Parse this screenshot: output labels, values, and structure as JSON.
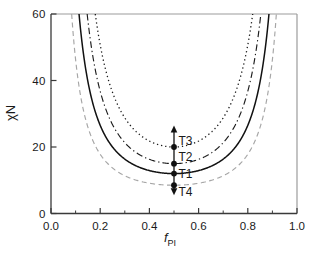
{
  "figure": {
    "ylabel": "χN",
    "xlabel_base": "f",
    "xlabel_sub": "PI"
  },
  "colors": {
    "background": "#ffffff",
    "axis": "#3a3a3a",
    "frame_light": "#9c9c9c",
    "text": "#1a1a1a",
    "marker": "#111111"
  },
  "chart_data": {
    "type": "line",
    "title": "",
    "xlabel": "f_PI",
    "ylabel": "χN",
    "xlim": [
      0.0,
      1.0
    ],
    "ylim": [
      0,
      60
    ],
    "grid": false,
    "legend": false,
    "frame": true,
    "x_major_ticks": [
      0.0,
      0.2,
      0.4,
      0.6,
      0.8,
      1.0
    ],
    "x_tick_labels": [
      "0.0",
      "0.2",
      "0.4",
      "0.6",
      "0.8",
      "1.0"
    ],
    "x_minor_ticks": [
      0.1,
      0.3,
      0.5,
      0.7,
      0.9
    ],
    "y_major_ticks": [
      0,
      20,
      40,
      60
    ],
    "y_tick_labels": [
      "0",
      "20",
      "40",
      "60"
    ],
    "series": [
      {
        "name": "boundary-dotted",
        "style": "dotted",
        "color": "#1c1c1c",
        "symmetric_about": 0.5,
        "min_chiN": 20.0,
        "f_at_ylim_top": 0.18
      },
      {
        "name": "boundary-dashdot",
        "style": "dashdot",
        "color": "#1c1c1c",
        "symmetric_about": 0.5,
        "min_chiN": 15.0,
        "f_at_ylim_top": 0.147
      },
      {
        "name": "boundary-solid",
        "style": "solid",
        "color": "#111111",
        "symmetric_about": 0.5,
        "min_chiN": 12.0,
        "f_at_ylim_top": 0.114
      },
      {
        "name": "boundary-dashed",
        "style": "dashed",
        "color": "#a6a6a6",
        "symmetric_about": 0.5,
        "min_chiN": 8.5,
        "f_at_ylim_top": 0.084
      }
    ],
    "points": [
      {
        "label": "T3",
        "x": 0.5,
        "y": 20.0,
        "label_pos": "above-right"
      },
      {
        "label": "T2",
        "x": 0.5,
        "y": 15.0,
        "label_pos": "above-right"
      },
      {
        "label": "T1",
        "x": 0.5,
        "y": 12.0,
        "label_pos": "right"
      },
      {
        "label": "T4",
        "x": 0.5,
        "y": 8.5,
        "label_pos": "below-right"
      }
    ],
    "arrow": {
      "x": 0.5,
      "y_top": 26.5,
      "y_bottom": 5.5,
      "heads": "both"
    }
  }
}
